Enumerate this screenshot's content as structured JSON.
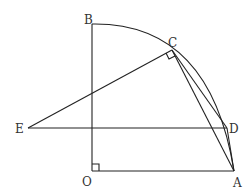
{
  "diagram": {
    "type": "geometry",
    "points": {
      "O": {
        "label": "O",
        "x": 92,
        "y": 171
      },
      "A": {
        "label": "A",
        "x": 234,
        "y": 171
      },
      "B": {
        "label": "B",
        "x": 92,
        "y": 24
      },
      "C": {
        "label": "C",
        "x": 172,
        "y": 50
      },
      "D": {
        "label": "D",
        "x": 227,
        "y": 128
      },
      "E": {
        "label": "E",
        "x": 28,
        "y": 128
      }
    },
    "segments": [
      "OB",
      "OA",
      "EC",
      "ED",
      "CA",
      "CD",
      "DA"
    ],
    "arcs": [
      "B-C-D-A (center O)"
    ],
    "right_angles": [
      "BOA at O",
      "ECA at C"
    ],
    "colors": {
      "stroke": "#222222",
      "label": "#333333",
      "background": "#ffffff"
    }
  }
}
